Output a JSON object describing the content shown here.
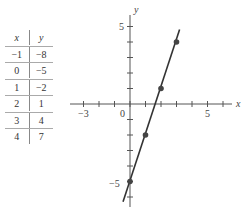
{
  "table": {
    "headers": [
      "x",
      "y"
    ],
    "rows": [
      [
        "−1",
        "−8"
      ],
      [
        "0",
        "−5"
      ],
      [
        "1",
        "−2"
      ],
      [
        "2",
        "1"
      ],
      [
        "3",
        "4"
      ],
      [
        "4",
        "7"
      ]
    ]
  },
  "axes": {
    "x_label": "x",
    "y_label": "y",
    "x_tick_labels": {
      "neg3": "−3",
      "zero": "0",
      "pos5": "5"
    },
    "y_tick_labels": {
      "pos5": "5",
      "neg5": "−5"
    }
  },
  "chart_data": {
    "type": "line",
    "title": "",
    "xlabel": "x",
    "ylabel": "y",
    "equation": "y = 3x - 5",
    "xlim": [
      -4,
      7
    ],
    "ylim": [
      -6,
      6
    ],
    "grid": false,
    "x_ticks": [
      -3,
      -2,
      -1,
      0,
      1,
      2,
      3,
      4,
      5,
      6
    ],
    "y_ticks": [
      -6,
      -5,
      -4,
      -3,
      -2,
      -1,
      1,
      2,
      3,
      4,
      5
    ],
    "labeled_x_ticks": [
      -3,
      0,
      5
    ],
    "labeled_y_ticks": [
      5,
      -5
    ],
    "table": {
      "x": [
        -1,
        0,
        1,
        2,
        3,
        4
      ],
      "y": [
        -8,
        -5,
        -2,
        1,
        4,
        7
      ]
    },
    "plotted_points": [
      {
        "x": 0,
        "y": -5
      },
      {
        "x": 1,
        "y": -2
      },
      {
        "x": 2,
        "y": 1
      },
      {
        "x": 3,
        "y": 4
      }
    ],
    "line_segment": {
      "from": {
        "x": -0.45,
        "y": -6.3
      },
      "to": {
        "x": 3.2,
        "y": 4.8
      }
    }
  }
}
